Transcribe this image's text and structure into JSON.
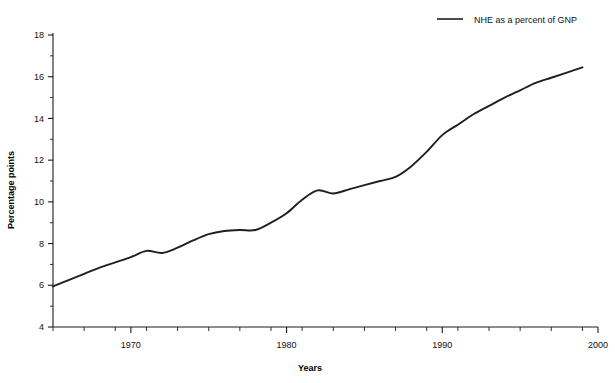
{
  "chart_data": {
    "type": "line",
    "title": "",
    "xlabel": "Years",
    "ylabel": "Percentage points",
    "xlim": [
      1965,
      2000
    ],
    "ylim": [
      4,
      18
    ],
    "grid": false,
    "legend_position": "top-right",
    "x_major_ticks": [
      1970,
      1980,
      1990,
      2000
    ],
    "x_major_tick_labels": [
      "1970",
      "1980",
      "1990",
      "2000"
    ],
    "x_minor_tick_step": 2,
    "y_major_ticks": [
      4,
      6,
      8,
      10,
      12,
      14,
      16,
      18
    ],
    "y_major_tick_labels": [
      "4",
      "6",
      "8",
      "10",
      "12",
      "14",
      "16",
      "18"
    ],
    "y_minor_ticks": [
      5,
      7,
      9,
      11,
      13,
      15,
      17
    ],
    "series": [
      {
        "name": "NHE as a percent of GNP",
        "color": "#1f1f1f",
        "x": [
          1965,
          1966,
          1967,
          1968,
          1969,
          1970,
          1971,
          1972,
          1973,
          1974,
          1975,
          1976,
          1977,
          1978,
          1979,
          1980,
          1981,
          1982,
          1983,
          1984,
          1985,
          1986,
          1987,
          1988,
          1989,
          1990,
          1991,
          1992,
          1993,
          1994,
          1995,
          1996,
          1997,
          1998,
          1999
        ],
        "values": [
          5.95,
          6.25,
          6.55,
          6.85,
          7.1,
          7.35,
          7.65,
          7.55,
          7.8,
          8.15,
          8.45,
          8.6,
          8.65,
          8.65,
          9.0,
          9.45,
          10.1,
          10.55,
          10.4,
          10.6,
          10.8,
          11.0,
          11.2,
          11.7,
          12.4,
          13.2,
          13.7,
          14.2,
          14.6,
          15.0,
          15.35,
          15.7,
          15.95,
          16.2,
          16.45
        ]
      }
    ],
    "legend": [
      {
        "label": "NHE as a percent of GNP",
        "color": "#1f1f1f",
        "style": "solid-line"
      }
    ]
  },
  "colors": {
    "series": "#1f1f1f",
    "axis": "#1a1a1a",
    "background": "#ffffff",
    "text": "#111111"
  }
}
